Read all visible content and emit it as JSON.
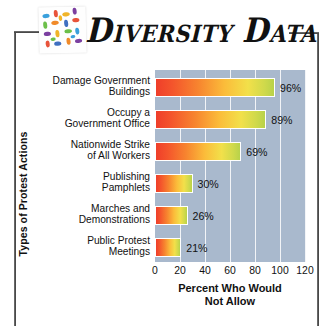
{
  "header": {
    "title": "Diversity Data",
    "logo_icon": "mosaic-tiles-icon"
  },
  "chart_data": {
    "type": "bar",
    "orientation": "horizontal",
    "title": "Diversity Data",
    "xlabel": "Percent Who Would Not Allow",
    "ylabel": "Types of Protest Actions",
    "categories": [
      "Damage Government Buildings",
      "Occupy a Government Office",
      "Nationwide Strike of All Workers",
      "Publishing Pamphlets",
      "Marches and Demonstrations",
      "Public Protest Meetings"
    ],
    "values": [
      96,
      89,
      69,
      30,
      26,
      21
    ],
    "value_labels": [
      "96%",
      "89%",
      "69%",
      "30%",
      "26%",
      "21%"
    ],
    "xlim": [
      0,
      120
    ],
    "xticks": [
      0,
      20,
      40,
      60,
      80,
      100,
      120
    ],
    "xtick_labels": [
      "0",
      "20",
      "40",
      "60",
      "80",
      "100",
      "120"
    ],
    "grid": true,
    "legend": "none",
    "plot_background": "#a9b9cd",
    "gridline_color": "#f2f4f7",
    "bar_gradient_start": "#ef3e2a",
    "bar_gradient_end": "#b8d24a"
  },
  "categories_wrapped": [
    [
      "Damage Government",
      "Buildings"
    ],
    [
      "Occupy a",
      "Government Office"
    ],
    [
      "Nationwide Strike",
      "of All Workers"
    ],
    [
      "Publishing",
      "Pamphlets"
    ],
    [
      "Marches and",
      "Demonstrations"
    ],
    [
      "Public Protest",
      "Meetings"
    ]
  ],
  "xlabel_lines": [
    "Percent Who Would",
    "Not Allow"
  ]
}
